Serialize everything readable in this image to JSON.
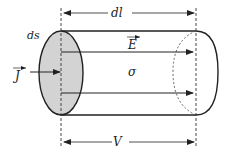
{
  "diagram": {
    "labels": {
      "area": "ds",
      "length": "dl",
      "field": "E",
      "conductivity": "σ",
      "current_density": "J",
      "voltage": "V"
    },
    "vector_labels": [
      "E",
      "J"
    ],
    "colors": {
      "stroke": "#222222",
      "face_fill": "#d3d3d3",
      "dashed": "#444444",
      "background": "#ffffff"
    },
    "field_lines": [
      {
        "y": 52
      },
      {
        "y": 93
      }
    ]
  }
}
